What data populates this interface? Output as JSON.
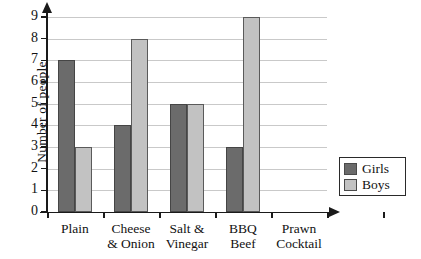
{
  "chart_data": {
    "type": "bar",
    "title": "",
    "xlabel": "",
    "ylabel": "Number of people",
    "ylim": [
      0,
      9
    ],
    "ytick_labels": [
      "0",
      "1",
      "2",
      "3",
      "4",
      "5",
      "6",
      "7",
      "8",
      "9"
    ],
    "grid": true,
    "legend_position": "bottom-right",
    "categories": [
      "Plain",
      "Cheese & Onion",
      "Salt & Vinegar",
      "BBQ Beef",
      "Prawn Cocktail"
    ],
    "category_lines": [
      [
        "Plain",
        ""
      ],
      [
        "Cheese",
        "& Onion"
      ],
      [
        "Salt &",
        "Vinegar"
      ],
      [
        "BBQ",
        "Beef"
      ],
      [
        "Prawn",
        "Cocktail"
      ]
    ],
    "series": [
      {
        "name": "Girls",
        "color": "#6b6b6b",
        "values": [
          7,
          4,
          5,
          3,
          0
        ]
      },
      {
        "name": "Boys",
        "color": "#c2c2c2",
        "values": [
          3,
          8,
          5,
          9,
          0
        ]
      }
    ]
  },
  "legend": {
    "items": [
      {
        "label": "Girls"
      },
      {
        "label": "Boys"
      }
    ]
  }
}
